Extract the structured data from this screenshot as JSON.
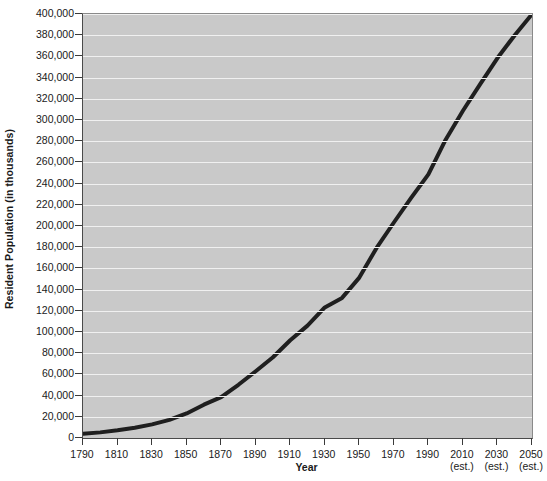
{
  "chart_data": {
    "type": "line",
    "title": "",
    "xlabel": "Year",
    "ylabel": "Resident Population (in thousands)",
    "xlim": [
      1790,
      2050
    ],
    "ylim": [
      0,
      400000
    ],
    "ytick_step": 20000,
    "xtick_step": 20,
    "grid": true,
    "legend": null,
    "plot_background_color": "#c9c9c9",
    "gridline_color": "#f0f0f0",
    "line_color": "#1f1f1f",
    "line_width_px": 4,
    "x_tick_labels": [
      {
        "label": "1790",
        "sub": ""
      },
      {
        "label": "1810",
        "sub": ""
      },
      {
        "label": "1830",
        "sub": ""
      },
      {
        "label": "1850",
        "sub": ""
      },
      {
        "label": "1870",
        "sub": ""
      },
      {
        "label": "1890",
        "sub": ""
      },
      {
        "label": "1910",
        "sub": ""
      },
      {
        "label": "1930",
        "sub": ""
      },
      {
        "label": "1950",
        "sub": ""
      },
      {
        "label": "1970",
        "sub": ""
      },
      {
        "label": "1990",
        "sub": ""
      },
      {
        "label": "2010",
        "sub": "(est.)"
      },
      {
        "label": "2030",
        "sub": "(est.)"
      },
      {
        "label": "2050",
        "sub": "(est.)"
      }
    ],
    "y_tick_labels": [
      "0",
      "20,000",
      "40,000",
      "60,000",
      "80,000",
      "100,000",
      "120,000",
      "140,000",
      "160,000",
      "180,000",
      "200,000",
      "220,000",
      "240,000",
      "260,000",
      "280,000",
      "300,000",
      "320,000",
      "340,000",
      "360,000",
      "380,000",
      "400,000"
    ],
    "y_tick_values": [
      0,
      20000,
      40000,
      60000,
      80000,
      100000,
      120000,
      140000,
      160000,
      180000,
      200000,
      220000,
      240000,
      260000,
      280000,
      300000,
      320000,
      340000,
      360000,
      380000,
      400000
    ],
    "x": [
      1790,
      1800,
      1810,
      1820,
      1830,
      1840,
      1850,
      1860,
      1870,
      1880,
      1890,
      1900,
      1910,
      1920,
      1930,
      1940,
      1950,
      1960,
      1970,
      1980,
      1990,
      2000,
      2010,
      2020,
      2030,
      2040,
      2050
    ],
    "values": [
      3929,
      5308,
      7240,
      9638,
      12866,
      17069,
      23192,
      31443,
      38558,
      50189,
      62980,
      76212,
      92228,
      106022,
      123203,
      132165,
      151326,
      179323,
      203302,
      226542,
      248710,
      281422,
      308746,
      333896,
      358471,
      380016,
      399803
    ],
    "series_name": "Resident Population"
  }
}
